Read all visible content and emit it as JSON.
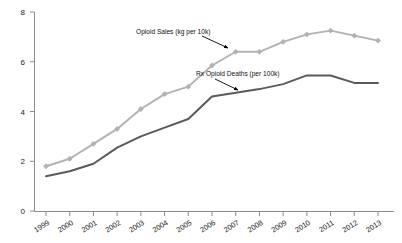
{
  "chart_data": {
    "type": "line",
    "title": "",
    "subtitle": "",
    "xlabel": "",
    "ylabel": "",
    "x": [
      1999,
      2000,
      2001,
      2002,
      2003,
      2004,
      2005,
      2006,
      2007,
      2008,
      2009,
      2010,
      2011,
      2012,
      2013
    ],
    "categories": [
      "1999",
      "2000",
      "2001",
      "2002",
      "2003",
      "2004",
      "2005",
      "2006",
      "2007",
      "2008",
      "2009",
      "2010",
      "2011",
      "2012",
      "2013"
    ],
    "xtick_labels": [
      "1999",
      "2000",
      "2001",
      "2002",
      "2003",
      "2004",
      "2005",
      "2006",
      "2007",
      "2008",
      "2009",
      "2010",
      "2011",
      "2012",
      "2013"
    ],
    "ytick_labels": [
      "0",
      "2",
      "4",
      "6",
      "8"
    ],
    "yticks": [
      0,
      2,
      4,
      6,
      8
    ],
    "ylim": [
      0,
      8
    ],
    "xlim": [
      1999,
      2013
    ],
    "grid": false,
    "legend": "none",
    "series": [
      {
        "name": "Opioid Sales (kg per 10k)",
        "color": "#b2b2b2",
        "marker": "diamond",
        "values": [
          1.8,
          2.1,
          2.7,
          3.3,
          4.1,
          4.7,
          5.0,
          5.85,
          6.4,
          6.4,
          6.8,
          7.1,
          7.25,
          7.05,
          6.85
        ]
      },
      {
        "name": "Rx Opioid Deaths (per 100k)",
        "color": "#5a5a5a",
        "marker": "none",
        "values": [
          1.4,
          1.6,
          1.9,
          2.55,
          3.0,
          3.35,
          3.7,
          4.6,
          4.75,
          4.9,
          5.1,
          5.45,
          5.45,
          5.15,
          5.15
        ]
      }
    ],
    "annotations": [
      {
        "name": "opioid-sales-annotation",
        "text": "Opioid Sales (kg per 10k)",
        "label_x": 136,
        "label_y": 34,
        "arrow_from_x": 202,
        "arrow_from_y": 36,
        "arrow_to_x": 228,
        "arrow_to_y": 48
      },
      {
        "name": "rx-opioid-deaths-annotation",
        "text": "Rx Opioid Deaths (per 100k)",
        "label_x": 196,
        "label_y": 76,
        "arrow_from_x": 215,
        "arrow_from_y": 79,
        "arrow_to_x": 238,
        "arrow_to_y": 90
      }
    ]
  }
}
